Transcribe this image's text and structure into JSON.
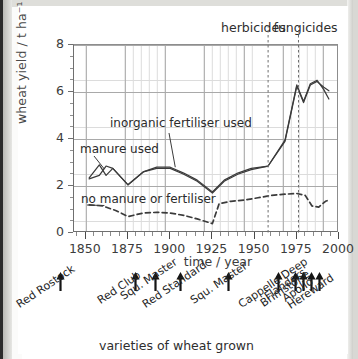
{
  "chart_data": {
    "type": "line",
    "title": "",
    "xlabel": "time / year",
    "ylabel": "wheat yield / t ha⁻¹",
    "xlim": [
      1843,
      2000
    ],
    "ylim": [
      0,
      8
    ],
    "xticks": [
      1850,
      1875,
      1900,
      1925,
      1950,
      1975,
      2000
    ],
    "yticks": [
      0,
      2,
      4,
      6,
      8
    ],
    "xtick_minor_step": 5,
    "ytick_minor_step": 0.5,
    "grid": true,
    "legend": "inline annotations",
    "series": [
      {
        "name": "manure used",
        "style": "solid",
        "x": [
          1852,
          1858,
          1862,
          1866,
          1875,
          1884,
          1892,
          1900,
          1908,
          1916,
          1925,
          1932,
          1940,
          1948,
          1958,
          1968,
          1975,
          1979,
          1983,
          1987,
          1991,
          1994
        ],
        "y": [
          2.35,
          2.9,
          2.45,
          2.75,
          2.05,
          2.6,
          2.8,
          2.8,
          2.55,
          2.25,
          1.75,
          2.25,
          2.55,
          2.75,
          2.85,
          3.95,
          6.3,
          5.6,
          6.35,
          6.5,
          6.1,
          5.7
        ]
      },
      {
        "name": "inorganic fertiliser used",
        "style": "solid",
        "x": [
          1852,
          1858,
          1862,
          1866,
          1875,
          1884,
          1892,
          1900,
          1908,
          1916,
          1925,
          1932,
          1940,
          1948,
          1958,
          1968,
          1975,
          1979,
          1983,
          1987,
          1991,
          1994
        ],
        "y": [
          2.3,
          2.45,
          2.85,
          2.75,
          2.05,
          2.6,
          2.75,
          2.75,
          2.5,
          2.2,
          1.7,
          2.2,
          2.5,
          2.7,
          2.85,
          3.9,
          6.25,
          5.55,
          6.3,
          6.45,
          6.2,
          6.05
        ]
      },
      {
        "name": "no manure or fertiliser",
        "style": "dashed",
        "x": [
          1852,
          1860,
          1868,
          1875,
          1884,
          1892,
          1900,
          1908,
          1916,
          1925,
          1929,
          1936,
          1944,
          1952,
          1960,
          1968,
          1975,
          1980,
          1984,
          1988,
          1992,
          1994
        ],
        "y": [
          1.2,
          1.15,
          0.95,
          0.7,
          0.85,
          0.88,
          0.85,
          0.75,
          0.6,
          0.4,
          1.25,
          1.35,
          1.4,
          1.5,
          1.6,
          1.65,
          1.68,
          1.6,
          1.15,
          1.1,
          1.35,
          1.4
        ]
      }
    ],
    "inline_labels": [
      {
        "text": "inorganic fertiliser used",
        "anchor_year": 1903,
        "anchor_value": 2.78
      },
      {
        "text": "manure used",
        "anchor_year": 1860,
        "anchor_value": 2.75
      },
      {
        "text": "no manure or fertiliser",
        "anchor_year": 1862,
        "anchor_value": 1.18
      }
    ],
    "event_lines": [
      {
        "label": "herbicides",
        "year": 1958
      },
      {
        "label": "fungicides",
        "year": 1976
      }
    ],
    "varieties_axis_title": "varieties of wheat grown",
    "varieties": [
      {
        "name": "Red Rostock",
        "year": 1852
      },
      {
        "name": "Red Club",
        "year": 1899
      },
      {
        "name": "Squ. Master",
        "year": 1912
      },
      {
        "name": "Red Standard",
        "year": 1928
      },
      {
        "name": "Squ. Master",
        "year": 1958
      },
      {
        "name": "Cappelle Deep",
        "year": 1990
      },
      {
        "name": "Flanders",
        "year": 2001
      },
      {
        "name": "Brimstone",
        "year": 2006
      },
      {
        "name": "Apollo",
        "year": 2011
      },
      {
        "name": "Hereward",
        "year": 2016
      }
    ]
  }
}
